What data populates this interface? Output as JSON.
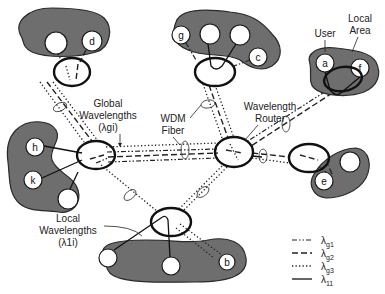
{
  "figure": {
    "labels": {
      "user": "User",
      "local_area_line1": "Local",
      "local_area_line2": "Area",
      "global_line1": "Global",
      "global_line2": "Wavelengths",
      "global_line3": "(λgi)",
      "wdm_line1": "WDM",
      "wdm_line2": "Fiber",
      "router_line1": "Wavelength",
      "router_line2": "Router",
      "local_wl_line1": "Local",
      "local_wl_line2": "Wavelengths",
      "local_wl_line3": "(λ1i)"
    },
    "nodes": {
      "a": "a",
      "b": "b",
      "c": "c",
      "d": "d",
      "e": "e",
      "f": "f",
      "g": "g",
      "h": "h",
      "k": "k"
    },
    "legend": [
      {
        "style": "dash-dot-dot",
        "symbol": "λ",
        "sub": "g1"
      },
      {
        "style": "dashed",
        "symbol": "λ",
        "sub": "g2"
      },
      {
        "style": "dotted",
        "symbol": "λ",
        "sub": "g3"
      },
      {
        "style": "solid",
        "symbol": "λ",
        "sub": "11"
      }
    ],
    "colors": {
      "area_fill": "#6e6e6e",
      "router_stroke": "#111111",
      "background": "#ffffff"
    }
  }
}
